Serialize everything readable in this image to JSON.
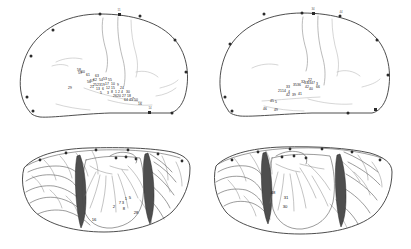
{
  "figure": {
    "background_color": "#ffffff",
    "ink_color": "#2b2b2b",
    "panel_count": 4,
    "panels": [
      {
        "id": "top-left",
        "name": "lateral-hemisphere-outline-left",
        "view": "lateral outline with numbered stimulation sites"
      },
      {
        "id": "top-right",
        "name": "lateral-hemisphere-outline-right",
        "view": "lateral outline with numbered stimulation sites"
      },
      {
        "id": "bottom-left",
        "name": "opened-sylvian-fissure-left",
        "view": "retracted sylvian fissure exposing insula"
      },
      {
        "id": "bottom-right",
        "name": "opened-sylvian-fissure-right",
        "view": "retracted sylvian fissure exposing insula"
      }
    ]
  },
  "panel_tl": {
    "edge_labels": [
      {
        "text": "11",
        "x": 119,
        "y": 16
      },
      {
        "text": "14",
        "x": 150,
        "y": 108
      }
    ],
    "sites": [
      {
        "n": "58",
        "x": 79,
        "y": 70
      },
      {
        "n": "59",
        "x": 80,
        "y": 73
      },
      {
        "n": "60",
        "x": 83,
        "y": 72
      },
      {
        "n": "61",
        "x": 88,
        "y": 75
      },
      {
        "n": "63",
        "x": 97,
        "y": 76
      },
      {
        "n": "62",
        "x": 95,
        "y": 80
      },
      {
        "n": "57",
        "x": 92,
        "y": 81
      },
      {
        "n": "56",
        "x": 89,
        "y": 82
      },
      {
        "n": "29",
        "x": 70,
        "y": 88
      },
      {
        "n": "54",
        "x": 101,
        "y": 80
      },
      {
        "n": "53",
        "x": 105,
        "y": 79
      },
      {
        "n": "55",
        "x": 110,
        "y": 80
      },
      {
        "n": "25",
        "x": 95,
        "y": 85
      },
      {
        "n": "21",
        "x": 92,
        "y": 87
      },
      {
        "n": "23",
        "x": 99,
        "y": 85
      },
      {
        "n": "19",
        "x": 103,
        "y": 85
      },
      {
        "n": "17",
        "x": 107,
        "y": 84
      },
      {
        "n": "10",
        "x": 113,
        "y": 84
      },
      {
        "n": "9",
        "x": 118,
        "y": 85
      },
      {
        "n": "13",
        "x": 98,
        "y": 89
      },
      {
        "n": "6",
        "x": 103,
        "y": 89
      },
      {
        "n": "12",
        "x": 108,
        "y": 88
      },
      {
        "n": "15",
        "x": 113,
        "y": 88
      },
      {
        "n": "24",
        "x": 122,
        "y": 88
      },
      {
        "n": "5",
        "x": 101,
        "y": 93
      },
      {
        "n": "3",
        "x": 108,
        "y": 93
      },
      {
        "n": "8",
        "x": 112,
        "y": 92
      },
      {
        "n": "1",
        "x": 116,
        "y": 92
      },
      {
        "n": "2",
        "x": 119,
        "y": 92
      },
      {
        "n": "4",
        "x": 122,
        "y": 92
      },
      {
        "n": "30",
        "x": 128,
        "y": 92
      },
      {
        "n": "26",
        "x": 115,
        "y": 96
      },
      {
        "n": "20",
        "x": 119,
        "y": 96
      },
      {
        "n": "27",
        "x": 124,
        "y": 96
      },
      {
        "n": "18",
        "x": 129,
        "y": 96
      },
      {
        "n": "7",
        "x": 133,
        "y": 99
      },
      {
        "n": "64",
        "x": 126,
        "y": 100
      },
      {
        "n": "45",
        "x": 131,
        "y": 100
      },
      {
        "n": "50",
        "x": 136,
        "y": 100
      },
      {
        "n": "16",
        "x": 140,
        "y": 104
      }
    ]
  },
  "panel_tr": {
    "edge_labels": [
      {
        "text": "34",
        "x": 313,
        "y": 14
      },
      {
        "text": "44",
        "x": 341,
        "y": 16
      }
    ],
    "sites": [
      {
        "n": "22",
        "x": 310,
        "y": 80
      },
      {
        "n": "32",
        "x": 303,
        "y": 82
      },
      {
        "n": "37",
        "x": 306,
        "y": 83
      },
      {
        "n": "43",
        "x": 309,
        "y": 83
      },
      {
        "n": "47",
        "x": 313,
        "y": 83
      },
      {
        "n": "3",
        "x": 317,
        "y": 84
      },
      {
        "n": "35",
        "x": 295,
        "y": 85
      },
      {
        "n": "36",
        "x": 299,
        "y": 85
      },
      {
        "n": "42",
        "x": 307,
        "y": 87
      },
      {
        "n": "66",
        "x": 318,
        "y": 87
      },
      {
        "n": "33",
        "x": 288,
        "y": 87
      },
      {
        "n": "40",
        "x": 311,
        "y": 89
      },
      {
        "n": "21",
        "x": 280,
        "y": 91
      },
      {
        "n": "14",
        "x": 284,
        "y": 91
      },
      {
        "n": "4",
        "x": 289,
        "y": 92
      },
      {
        "n": "42",
        "x": 288,
        "y": 95
      },
      {
        "n": "39",
        "x": 294,
        "y": 95
      },
      {
        "n": "41",
        "x": 300,
        "y": 94
      },
      {
        "n": "45",
        "x": 272,
        "y": 101
      },
      {
        "n": "5",
        "x": 276,
        "y": 102
      },
      {
        "n": "46",
        "x": 265,
        "y": 109
      },
      {
        "n": "49",
        "x": 276,
        "y": 110
      }
    ]
  },
  "panel_bl": {
    "sites": [
      {
        "n": "2",
        "x": 114,
        "y": 207
      },
      {
        "n": "7",
        "x": 120,
        "y": 203
      },
      {
        "n": "3",
        "x": 123,
        "y": 203
      },
      {
        "n": "1",
        "x": 126,
        "y": 199
      },
      {
        "n": "5",
        "x": 130,
        "y": 198
      },
      {
        "n": "8",
        "x": 124,
        "y": 209
      },
      {
        "n": "16",
        "x": 94,
        "y": 220
      },
      {
        "n": "28",
        "x": 136,
        "y": 213
      }
    ]
  },
  "panel_br": {
    "sites": [
      {
        "n": "48",
        "x": 273,
        "y": 193
      },
      {
        "n": "31",
        "x": 286,
        "y": 198
      },
      {
        "n": "30",
        "x": 285,
        "y": 207
      }
    ]
  }
}
